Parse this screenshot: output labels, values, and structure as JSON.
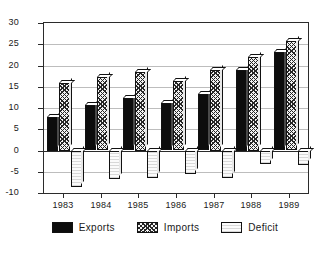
{
  "chart_data": {
    "type": "bar",
    "title": "",
    "subtitle": "",
    "xlabel": "",
    "ylabel": "",
    "categories": [
      "1983",
      "1984",
      "1985",
      "1986",
      "1987",
      "1988",
      "1989"
    ],
    "series": [
      {
        "name": "Exports",
        "values": [
          8.0,
          10.6,
          12.3,
          11.2,
          13.2,
          19.0,
          23.2
        ],
        "fill": "solid-black",
        "color": "#0d0d0d"
      },
      {
        "name": "Imports",
        "values": [
          16.0,
          17.2,
          18.5,
          16.4,
          19.0,
          22.0,
          25.7
        ],
        "fill": "diagonal-crosshatch",
        "color": "#262626"
      },
      {
        "name": "Deficit",
        "values": [
          -8.6,
          -6.8,
          -6.4,
          -5.6,
          -6.4,
          -3.2,
          -3.4
        ],
        "fill": "light-dotted",
        "color": "#fbfbfb"
      }
    ],
    "ylim": [
      -10,
      30
    ],
    "yticks": [
      -10,
      -5,
      0,
      5,
      10,
      15,
      20,
      25,
      30
    ],
    "ytick_labels": [
      "-10",
      "-5",
      "0",
      "5",
      "10",
      "15",
      "20",
      "25",
      "30"
    ],
    "grid": true,
    "grid_axis": "y",
    "legend_position": "bottom",
    "legend_entries": [
      "Exports",
      "Imports",
      "Deficit"
    ],
    "annotations": [],
    "background_color": "#ffffff",
    "axis_color": "#2b2b2b",
    "gridline_color": "#bdbdbd"
  },
  "legend": {
    "items": [
      {
        "label": "Exports"
      },
      {
        "label": "Imports"
      },
      {
        "label": "Deficit"
      }
    ]
  }
}
